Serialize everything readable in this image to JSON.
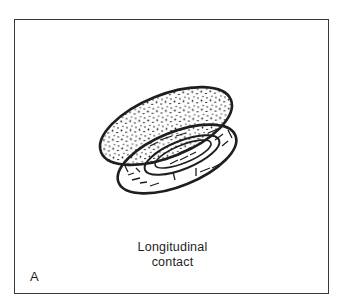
{
  "figure": {
    "panel_label": "A",
    "caption_line1": "Longitudinal",
    "caption_line2": "contact",
    "illustration": "two-elongated-cells-in-longitudinal-contact",
    "colors": {
      "ink": "#1e1e1e",
      "background": "#ffffff",
      "frame": "#3a3a3a"
    }
  }
}
